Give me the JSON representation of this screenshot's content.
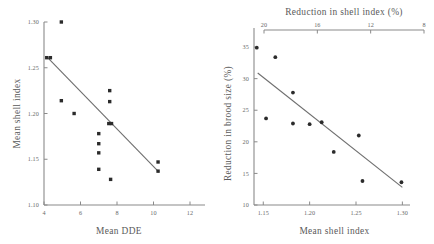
{
  "figure": {
    "panels": [
      "left",
      "right"
    ]
  },
  "chart_data": [
    {
      "type": "scatter",
      "title": "",
      "xlabel": "Mean DDE",
      "ylabel": "Mean shell index",
      "xlim": [
        4,
        12
      ],
      "ylim": [
        1.1,
        1.3
      ],
      "xticks": [
        4,
        6,
        8,
        10,
        12
      ],
      "xticklabels": [
        "4",
        "6",
        "8",
        "10",
        "12"
      ],
      "yticks": [
        1.1,
        1.15,
        1.2,
        1.25,
        1.3
      ],
      "yticklabels": [
        "1.10",
        "1.15",
        "1.20",
        "1.25",
        "1.30"
      ],
      "grid": false,
      "legend": null,
      "points": [
        {
          "x": 4.15,
          "y": 1.261
        },
        {
          "x": 4.35,
          "y": 1.261
        },
        {
          "x": 4.95,
          "y": 1.3
        },
        {
          "x": 4.95,
          "y": 1.214
        },
        {
          "x": 5.65,
          "y": 1.2
        },
        {
          "x": 7.0,
          "y": 1.178
        },
        {
          "x": 7.0,
          "y": 1.167
        },
        {
          "x": 7.0,
          "y": 1.157
        },
        {
          "x": 7.0,
          "y": 1.139
        },
        {
          "x": 7.6,
          "y": 1.225
        },
        {
          "x": 7.6,
          "y": 1.213
        },
        {
          "x": 7.55,
          "y": 1.189
        },
        {
          "x": 7.7,
          "y": 1.189
        },
        {
          "x": 7.65,
          "y": 1.128
        },
        {
          "x": 10.25,
          "y": 1.147
        },
        {
          "x": 10.25,
          "y": 1.137
        }
      ],
      "fit_line": {
        "x": [
          4.2,
          10.3
        ],
        "y": [
          1.261,
          1.136
        ]
      }
    },
    {
      "type": "scatter",
      "title": "",
      "xlabel": "Mean shell index",
      "ylabel": "Reduction in brood size (%)",
      "top_xlabel": "Reduction in shell index (%)",
      "xlim": [
        1.14,
        1.305
      ],
      "ylim": [
        10,
        35.8
      ],
      "xticks": [
        1.15,
        1.2,
        1.25,
        1.3
      ],
      "xticklabels": [
        "1.15",
        "1.20",
        "1.25",
        "1.30"
      ],
      "yticks": [
        10,
        15,
        20,
        25,
        30,
        35
      ],
      "yticklabels": [
        "10",
        "15",
        "20",
        "25",
        "30",
        "35"
      ],
      "top_xticks": [
        20,
        16,
        12,
        8
      ],
      "top_xticklabels": [
        "20",
        "16",
        "12",
        "8"
      ],
      "top_axis_reversed": true,
      "grid": false,
      "legend": null,
      "points": [
        {
          "x": 1.143,
          "y": 34.9
        },
        {
          "x": 1.163,
          "y": 33.4
        },
        {
          "x": 1.182,
          "y": 27.8
        },
        {
          "x": 1.153,
          "y": 23.7
        },
        {
          "x": 1.182,
          "y": 22.9
        },
        {
          "x": 1.2,
          "y": 22.8
        },
        {
          "x": 1.213,
          "y": 23.1
        },
        {
          "x": 1.226,
          "y": 18.4
        },
        {
          "x": 1.253,
          "y": 21.0
        },
        {
          "x": 1.257,
          "y": 13.8
        },
        {
          "x": 1.299,
          "y": 13.6
        }
      ],
      "fit_line": {
        "x": [
          1.144,
          1.3
        ],
        "y": [
          30.9,
          12.8
        ]
      }
    }
  ]
}
